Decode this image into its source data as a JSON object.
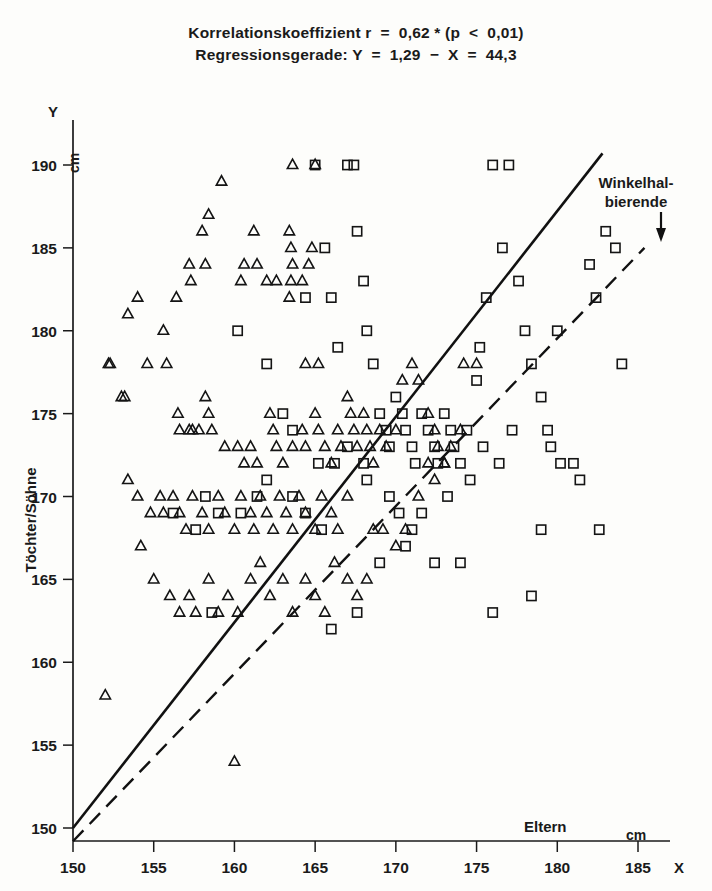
{
  "title": {
    "line1": "Korrelationskoeffizient r  =  0,62 * (p  <  0,01)",
    "line2": "Regressionsgerade: Y  =  1,29  −  X  =  44,3"
  },
  "annotations": {
    "bisector_line1": "Winkelhal-",
    "bisector_line2": "bierende",
    "x_axis_unit": "cm",
    "y_axis_unit": "cm",
    "x_axis_symbol": "X",
    "y_axis_symbol": "Y"
  },
  "chart_data": {
    "type": "scatter",
    "title": "Korrelationskoeffizient r  =  0,62 * (p  <  0,01)",
    "subtitle": "Regressionsgerade: Y  =  1,29  −  X  =  44,3",
    "xlabel": "Eltern",
    "ylabel": "Töchter/Söhne",
    "xunit": "cm",
    "yunit": "cm",
    "xlim": [
      150,
      185
    ],
    "ylim": [
      150,
      190
    ],
    "xticks": [
      150,
      155,
      160,
      165,
      170,
      175,
      180,
      185
    ],
    "yticks": [
      150,
      155,
      160,
      165,
      170,
      175,
      180,
      185,
      190
    ],
    "grid": false,
    "legend": false,
    "correlation_r": 0.62,
    "p_value": "< 0,01",
    "regression": {
      "slope": 1.29,
      "intercept": -44.3,
      "label": "Regressionsgerade",
      "style": "solid"
    },
    "bisector": {
      "slope": 1.0,
      "intercept": 0,
      "label": "Winkelhalbierende",
      "style": "dashed"
    },
    "series": [
      {
        "name": "Töchter",
        "marker": "triangle",
        "points": [
          [
            152,
            158
          ],
          [
            160,
            154
          ],
          [
            153.4,
            181
          ],
          [
            152.2,
            178
          ],
          [
            153.0,
            176
          ],
          [
            154.0,
            182
          ],
          [
            155.6,
            180
          ],
          [
            156.4,
            182
          ],
          [
            157.2,
            184
          ],
          [
            157.3,
            183
          ],
          [
            158.0,
            186
          ],
          [
            158.2,
            184
          ],
          [
            158.4,
            187
          ],
          [
            159.2,
            189
          ],
          [
            160.4,
            183
          ],
          [
            160.6,
            184
          ],
          [
            161.2,
            186
          ],
          [
            161.4,
            184
          ],
          [
            162.0,
            183
          ],
          [
            162.6,
            183
          ],
          [
            163.4,
            186
          ],
          [
            163.6,
            190
          ],
          [
            163.5,
            185
          ],
          [
            163.6,
            184
          ],
          [
            163.5,
            183
          ],
          [
            163.4,
            182
          ],
          [
            164.2,
            183
          ],
          [
            165.0,
            190
          ],
          [
            164.8,
            185
          ],
          [
            164.6,
            184
          ],
          [
            165.2,
            178
          ],
          [
            164.4,
            178
          ],
          [
            152.3,
            178
          ],
          [
            153.2,
            176
          ],
          [
            154.6,
            178
          ],
          [
            155.8,
            178
          ],
          [
            156.5,
            175
          ],
          [
            156.6,
            174
          ],
          [
            157.2,
            174
          ],
          [
            157.4,
            174
          ],
          [
            157.8,
            174
          ],
          [
            158.2,
            176
          ],
          [
            158.4,
            175
          ],
          [
            158.6,
            174
          ],
          [
            159.4,
            173
          ],
          [
            160.2,
            173
          ],
          [
            160.6,
            172
          ],
          [
            161.0,
            173
          ],
          [
            161.4,
            172
          ],
          [
            162.2,
            175
          ],
          [
            162.4,
            174
          ],
          [
            162.6,
            173
          ],
          [
            163.0,
            172
          ],
          [
            163.6,
            173
          ],
          [
            164.2,
            174
          ],
          [
            164.4,
            173
          ],
          [
            165.0,
            175
          ],
          [
            165.2,
            174
          ],
          [
            165.6,
            173
          ],
          [
            166.0,
            172
          ],
          [
            166.4,
            174
          ],
          [
            166.6,
            173
          ],
          [
            167.0,
            176
          ],
          [
            167.2,
            175
          ],
          [
            167.4,
            174
          ],
          [
            167.6,
            173
          ],
          [
            168.0,
            175
          ],
          [
            168.2,
            174
          ],
          [
            168.4,
            173
          ],
          [
            168.6,
            172
          ],
          [
            169.0,
            174
          ],
          [
            169.4,
            173
          ],
          [
            170.0,
            174
          ],
          [
            170.4,
            177
          ],
          [
            171.0,
            178
          ],
          [
            171.4,
            177
          ],
          [
            172.0,
            175
          ],
          [
            172.4,
            174
          ],
          [
            172.6,
            173
          ],
          [
            173.0,
            172
          ],
          [
            153.4,
            171
          ],
          [
            154.0,
            170
          ],
          [
            154.8,
            169
          ],
          [
            155.4,
            170
          ],
          [
            155.6,
            169
          ],
          [
            156.2,
            170
          ],
          [
            156.6,
            169
          ],
          [
            157.0,
            168
          ],
          [
            157.4,
            170
          ],
          [
            158.0,
            169
          ],
          [
            158.4,
            168
          ],
          [
            159.0,
            170
          ],
          [
            159.4,
            169
          ],
          [
            160.0,
            168
          ],
          [
            160.4,
            170
          ],
          [
            161.0,
            169
          ],
          [
            161.2,
            168
          ],
          [
            161.6,
            170
          ],
          [
            162.0,
            169
          ],
          [
            162.4,
            168
          ],
          [
            162.8,
            170
          ],
          [
            163.2,
            169
          ],
          [
            163.6,
            168
          ],
          [
            164.0,
            170
          ],
          [
            164.4,
            169
          ],
          [
            165.0,
            168
          ],
          [
            165.4,
            170
          ],
          [
            166.0,
            169
          ],
          [
            166.4,
            168
          ],
          [
            167.0,
            170
          ],
          [
            154.2,
            167
          ],
          [
            155.0,
            165
          ],
          [
            156.0,
            164
          ],
          [
            156.6,
            163
          ],
          [
            157.2,
            164
          ],
          [
            157.6,
            163
          ],
          [
            158.4,
            165
          ],
          [
            159.0,
            163
          ],
          [
            159.6,
            164
          ],
          [
            160.2,
            163
          ],
          [
            161.0,
            165
          ],
          [
            161.6,
            166
          ],
          [
            162.2,
            164
          ],
          [
            163.0,
            165
          ],
          [
            163.6,
            163
          ],
          [
            164.4,
            165
          ],
          [
            165.0,
            164
          ],
          [
            165.6,
            163
          ],
          [
            166.2,
            166
          ],
          [
            167.0,
            165
          ],
          [
            167.6,
            164
          ],
          [
            168.2,
            165
          ],
          [
            168.6,
            168
          ],
          [
            169.2,
            168
          ],
          [
            170.0,
            167
          ],
          [
            170.6,
            168
          ],
          [
            171.4,
            170
          ],
          [
            172.0,
            172
          ],
          [
            172.4,
            171
          ],
          [
            173.0,
            172
          ],
          [
            173.4,
            173
          ],
          [
            174.0,
            174
          ],
          [
            174.2,
            178
          ],
          [
            175.0,
            178
          ]
        ]
      },
      {
        "name": "Söhne",
        "marker": "square",
        "points": [
          [
            160.2,
            180
          ],
          [
            162.0,
            178
          ],
          [
            163.0,
            175
          ],
          [
            163.6,
            174
          ],
          [
            164.4,
            182
          ],
          [
            165.0,
            190
          ],
          [
            165.6,
            185
          ],
          [
            166.0,
            182
          ],
          [
            166.4,
            179
          ],
          [
            167.0,
            190
          ],
          [
            167.4,
            190
          ],
          [
            167.6,
            186
          ],
          [
            168.0,
            183
          ],
          [
            168.2,
            180
          ],
          [
            168.6,
            178
          ],
          [
            169.0,
            175
          ],
          [
            169.4,
            174
          ],
          [
            169.6,
            173
          ],
          [
            170.0,
            176
          ],
          [
            170.4,
            175
          ],
          [
            170.6,
            174
          ],
          [
            171.0,
            173
          ],
          [
            171.2,
            172
          ],
          [
            171.6,
            175
          ],
          [
            172.0,
            174
          ],
          [
            172.4,
            173
          ],
          [
            172.6,
            172
          ],
          [
            173.0,
            175
          ],
          [
            173.4,
            174
          ],
          [
            173.6,
            173
          ],
          [
            174.0,
            172
          ],
          [
            174.4,
            174
          ],
          [
            175.0,
            177
          ],
          [
            175.2,
            179
          ],
          [
            175.6,
            182
          ],
          [
            176.0,
            190
          ],
          [
            176.6,
            185
          ],
          [
            177.0,
            190
          ],
          [
            177.6,
            183
          ],
          [
            178.0,
            180
          ],
          [
            178.4,
            178
          ],
          [
            179.0,
            176
          ],
          [
            179.4,
            174
          ],
          [
            179.6,
            173
          ],
          [
            180.0,
            180
          ],
          [
            180.2,
            172
          ],
          [
            181.0,
            172
          ],
          [
            181.4,
            171
          ],
          [
            182.0,
            184
          ],
          [
            182.4,
            182
          ],
          [
            183.0,
            186
          ],
          [
            183.6,
            185
          ],
          [
            184.0,
            178
          ],
          [
            182.6,
            168
          ],
          [
            179.0,
            168
          ],
          [
            178.4,
            164
          ],
          [
            176.0,
            163
          ],
          [
            174.0,
            166
          ],
          [
            172.4,
            166
          ],
          [
            170.6,
            167
          ],
          [
            169.0,
            166
          ],
          [
            167.6,
            163
          ],
          [
            166.0,
            162
          ],
          [
            165.4,
            168
          ],
          [
            164.4,
            169
          ],
          [
            163.6,
            170
          ],
          [
            162.0,
            171
          ],
          [
            161.4,
            170
          ],
          [
            160.4,
            169
          ],
          [
            159.0,
            169
          ],
          [
            158.2,
            170
          ],
          [
            156.2,
            169
          ],
          [
            157.6,
            168
          ],
          [
            158.6,
            163
          ],
          [
            168.2,
            171
          ],
          [
            169.6,
            170
          ],
          [
            170.2,
            169
          ],
          [
            171.0,
            168
          ],
          [
            166.2,
            172
          ],
          [
            165.2,
            172
          ],
          [
            167.0,
            173
          ],
          [
            168.0,
            172
          ],
          [
            175.4,
            173
          ],
          [
            176.4,
            172
          ],
          [
            177.2,
            174
          ],
          [
            173.2,
            170
          ],
          [
            174.6,
            171
          ],
          [
            171.6,
            169
          ]
        ]
      }
    ]
  }
}
